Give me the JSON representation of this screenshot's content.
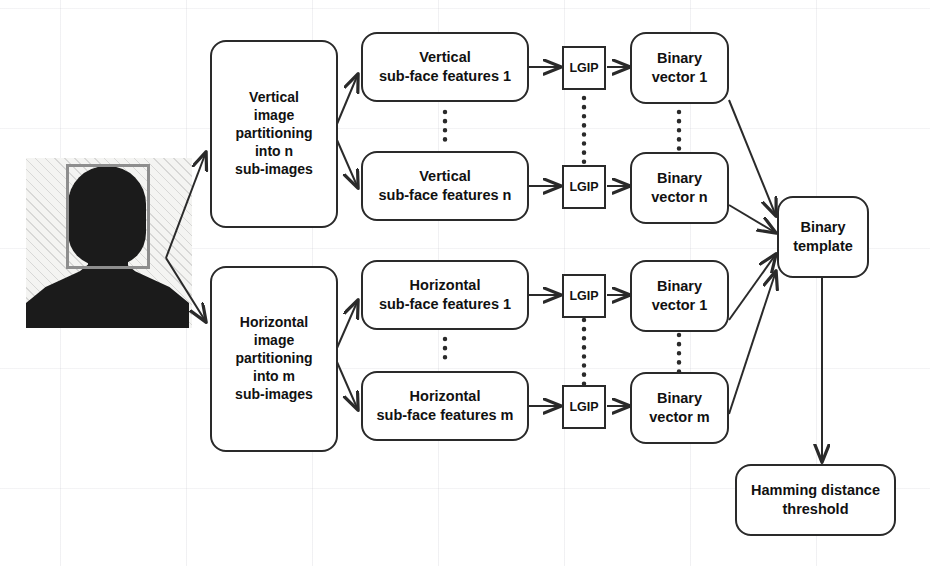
{
  "diagram": {
    "colors": {
      "stroke": "#2a2a2a",
      "text": "#111111",
      "silhouette": "#1b1b1b",
      "detection_box": "#8e8e8e",
      "photo_background": "#f4f4f2"
    },
    "input": {
      "name": "face-photo",
      "description": "face silhouette photo with detection rectangle"
    },
    "nodes": [
      {
        "id": "vertical-partitioning",
        "label": "Vertical\nimage\npartitioning\ninto n\nsub-images",
        "shape": "rounded"
      },
      {
        "id": "horizontal-partitioning",
        "label": "Horizontal\nimage\npartitioning\ninto m\nsub-images",
        "shape": "rounded"
      },
      {
        "id": "vertical-features-1",
        "label": "Vertical\nsub-face features 1",
        "shape": "rounded"
      },
      {
        "id": "vertical-features-n",
        "label": "Vertical\nsub-face features n",
        "shape": "rounded"
      },
      {
        "id": "horizontal-features-1",
        "label": "Horizontal\nsub-face features 1",
        "shape": "rounded"
      },
      {
        "id": "horizontal-features-m",
        "label": "Horizontal\nsub-face features m",
        "shape": "rounded"
      },
      {
        "id": "lgip-1",
        "label": "LGIP",
        "shape": "square"
      },
      {
        "id": "lgip-2",
        "label": "LGIP",
        "shape": "square"
      },
      {
        "id": "lgip-3",
        "label": "LGIP",
        "shape": "square"
      },
      {
        "id": "lgip-4",
        "label": "LGIP",
        "shape": "square"
      },
      {
        "id": "binary-vector-1v",
        "label": "Binary\nvector 1",
        "shape": "rounded"
      },
      {
        "id": "binary-vector-n",
        "label": "Binary\nvector n",
        "shape": "rounded"
      },
      {
        "id": "binary-vector-1h",
        "label": "Binary\nvector 1",
        "shape": "rounded"
      },
      {
        "id": "binary-vector-m",
        "label": "Binary\nvector m",
        "shape": "rounded"
      },
      {
        "id": "binary-template",
        "label": "Binary\ntemplate",
        "shape": "rounded"
      },
      {
        "id": "hamming-threshold",
        "label": "Hamming distance\nthreshold",
        "shape": "rounded"
      }
    ],
    "labels": {
      "vertical_partitioning": "Vertical\nimage\npartitioning\ninto n\nsub-images",
      "horizontal_partitioning": "Horizontal\nimage\npartitioning\ninto m\nsub-images",
      "vertical_features_1": "Vertical\nsub-face features 1",
      "vertical_features_n": "Vertical\nsub-face features n",
      "horizontal_features_1": "Horizontal\nsub-face features 1",
      "horizontal_features_m": "Horizontal\nsub-face features m",
      "lgip": "LGIP",
      "binary_vector_1": "Binary\nvector 1",
      "binary_vector_n": "Binary\nvector n",
      "binary_vector_m": "Binary\nvector m",
      "binary_template": "Binary\ntemplate",
      "hamming_threshold": "Hamming distance\nthreshold"
    },
    "ellipsis": {
      "style": "vertical dotted line",
      "count": 6
    },
    "edges": [
      {
        "from": "face-photo",
        "to": "vertical-partitioning"
      },
      {
        "from": "face-photo",
        "to": "horizontal-partitioning"
      },
      {
        "from": "vertical-partitioning",
        "to": "vertical-features-1"
      },
      {
        "from": "vertical-partitioning",
        "to": "vertical-features-n"
      },
      {
        "from": "horizontal-partitioning",
        "to": "horizontal-features-1"
      },
      {
        "from": "horizontal-partitioning",
        "to": "horizontal-features-m"
      },
      {
        "from": "vertical-features-1",
        "to": "lgip-1"
      },
      {
        "from": "vertical-features-n",
        "to": "lgip-2"
      },
      {
        "from": "horizontal-features-1",
        "to": "lgip-3"
      },
      {
        "from": "horizontal-features-m",
        "to": "lgip-4"
      },
      {
        "from": "lgip-1",
        "to": "binary-vector-1v"
      },
      {
        "from": "lgip-2",
        "to": "binary-vector-n"
      },
      {
        "from": "lgip-3",
        "to": "binary-vector-1h"
      },
      {
        "from": "lgip-4",
        "to": "binary-vector-m"
      },
      {
        "from": "binary-vector-1v",
        "to": "binary-template"
      },
      {
        "from": "binary-vector-n",
        "to": "binary-template"
      },
      {
        "from": "binary-vector-1h",
        "to": "binary-template"
      },
      {
        "from": "binary-vector-m",
        "to": "binary-template"
      },
      {
        "from": "binary-template",
        "to": "hamming-threshold"
      }
    ]
  }
}
